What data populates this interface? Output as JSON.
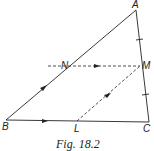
{
  "figure": {
    "caption": "Fig. 18.2",
    "points": {
      "A": {
        "label": "A",
        "x": 136,
        "y": 10
      },
      "B": {
        "label": "B",
        "x": 6,
        "y": 120
      },
      "C": {
        "label": "C",
        "x": 149,
        "y": 122
      },
      "M": {
        "label": "M",
        "x": 140,
        "y": 66
      },
      "N": {
        "label": "N",
        "x": 70,
        "y": 66
      },
      "L": {
        "label": "L",
        "x": 77,
        "y": 121
      }
    },
    "segments": [
      {
        "name": "AB",
        "style": "solid",
        "arrow": true
      },
      {
        "name": "BC",
        "style": "solid",
        "arrow": true
      },
      {
        "name": "AC",
        "style": "solid",
        "ticks": [
          "AM",
          "MC"
        ]
      },
      {
        "name": "NM",
        "style": "dashed",
        "arrow": true,
        "extended_left": true
      },
      {
        "name": "LM",
        "style": "dashed",
        "arrow": true
      }
    ],
    "colors": {
      "line": "#222222",
      "background": "#ffffff"
    }
  }
}
